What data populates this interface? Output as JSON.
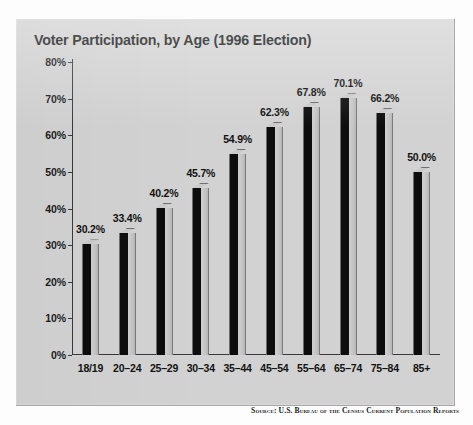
{
  "chart_data": {
    "type": "bar",
    "title": "Voter Participation, by Age (1996 Election)",
    "xlabel": "",
    "ylabel": "",
    "ylim": [
      0,
      80
    ],
    "ytick_step": 10,
    "ytick_labels": [
      "0%",
      "10%",
      "20%",
      "30%",
      "40%",
      "50%",
      "60%",
      "70%",
      "80%"
    ],
    "ytick_values": [
      0,
      10,
      20,
      30,
      40,
      50,
      60,
      70,
      80
    ],
    "grid": false,
    "legend": false,
    "value_labels": true,
    "categories": [
      "18/19",
      "20–24",
      "25–29",
      "30–34",
      "35–44",
      "45–54",
      "55–64",
      "65–74",
      "75–84",
      "85+"
    ],
    "values": [
      30.2,
      33.4,
      40.2,
      45.7,
      54.9,
      62.3,
      67.8,
      70.1,
      66.2,
      50.0
    ],
    "value_label_texts": [
      "30.2%",
      "33.4%",
      "40.2%",
      "45.7%",
      "54.9%",
      "62.3%",
      "67.8%",
      "70.1%",
      "66.2%",
      "50.0%"
    ],
    "series": [
      {
        "name": "Voter participation",
        "values": [
          30.2,
          33.4,
          40.2,
          45.7,
          54.9,
          62.3,
          67.8,
          70.1,
          66.2,
          50.0
        ]
      }
    ],
    "bar_style": "3d-extruded",
    "colors": {
      "bar_front": "#0d0d0d",
      "bar_side": "#c5c5c5",
      "bar_top": "#c9c9c9",
      "panel_background": "#d2d2d2",
      "page_background": "#fdfdfd",
      "axis": "#3a3a3a",
      "text": "#111111"
    }
  },
  "source_note": "Source: U.S. Bureau of the Census Current Population Reports"
}
